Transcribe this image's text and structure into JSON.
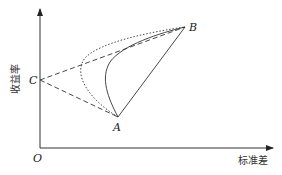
{
  "diagram": {
    "title": "",
    "axes": {
      "origin_label": "O",
      "x_label": "标准差",
      "y_label": "收益率"
    },
    "points": [
      {
        "id": "C",
        "label": "C",
        "x": 40,
        "y": 80
      },
      {
        "id": "A",
        "label": "A",
        "x": 118,
        "y": 117
      },
      {
        "id": "B",
        "label": "B",
        "x": 185,
        "y": 27
      }
    ],
    "lines": [
      {
        "from": "C",
        "to": "B",
        "style": "dashed"
      },
      {
        "from": "C",
        "to": "A",
        "style": "dashed"
      },
      {
        "from": "A",
        "to": "B",
        "style": "solid"
      }
    ],
    "curves": [
      {
        "from": "A",
        "to": "B",
        "style": "solid",
        "description": "frontier curve bowing left"
      },
      {
        "from": "A",
        "to": "B",
        "style": "dotted",
        "description": "frontier curve bowing further left"
      }
    ],
    "colors": {
      "stroke": "#333333",
      "background": "#ffffff"
    }
  }
}
